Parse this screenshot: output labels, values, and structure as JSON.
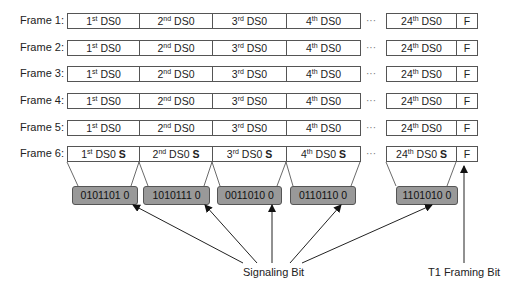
{
  "frames": [
    {
      "label": "Frame 1:",
      "cells": [
        {
          "n": "1",
          "sup": "st",
          "t": " DS0",
          "s": ""
        },
        {
          "n": "2",
          "sup": "nd",
          "t": " DS0",
          "s": ""
        },
        {
          "n": "3",
          "sup": "rd",
          "t": " DS0",
          "s": ""
        },
        {
          "n": "4",
          "sup": "th",
          "t": " DS0",
          "s": ""
        },
        {
          "n": "24",
          "sup": "th",
          "t": " DS0",
          "s": ""
        }
      ],
      "f": "F"
    },
    {
      "label": "Frame 2:",
      "cells": [
        {
          "n": "1",
          "sup": "st",
          "t": " DS0",
          "s": ""
        },
        {
          "n": "2",
          "sup": "nd",
          "t": " DS0",
          "s": ""
        },
        {
          "n": "3",
          "sup": "rd",
          "t": " DS0",
          "s": ""
        },
        {
          "n": "4",
          "sup": "th",
          "t": " DS0",
          "s": ""
        },
        {
          "n": "24",
          "sup": "th",
          "t": " DS0",
          "s": ""
        }
      ],
      "f": "F"
    },
    {
      "label": "Frame 3:",
      "cells": [
        {
          "n": "1",
          "sup": "st",
          "t": " DS0",
          "s": ""
        },
        {
          "n": "2",
          "sup": "nd",
          "t": " DS0",
          "s": ""
        },
        {
          "n": "3",
          "sup": "rd",
          "t": " DS0",
          "s": ""
        },
        {
          "n": "4",
          "sup": "th",
          "t": " DS0",
          "s": ""
        },
        {
          "n": "24",
          "sup": "th",
          "t": " DS0",
          "s": ""
        }
      ],
      "f": "F"
    },
    {
      "label": "Frame 4:",
      "cells": [
        {
          "n": "1",
          "sup": "st",
          "t": " DS0",
          "s": ""
        },
        {
          "n": "2",
          "sup": "nd",
          "t": " DS0",
          "s": ""
        },
        {
          "n": "3",
          "sup": "rd",
          "t": " DS0",
          "s": ""
        },
        {
          "n": "4",
          "sup": "th",
          "t": " DS0",
          "s": ""
        },
        {
          "n": "24",
          "sup": "th",
          "t": " DS0",
          "s": ""
        }
      ],
      "f": "F"
    },
    {
      "label": "Frame 5:",
      "cells": [
        {
          "n": "1",
          "sup": "st",
          "t": " DS0",
          "s": ""
        },
        {
          "n": "2",
          "sup": "nd",
          "t": " DS0",
          "s": ""
        },
        {
          "n": "3",
          "sup": "rd",
          "t": " DS0",
          "s": ""
        },
        {
          "n": "4",
          "sup": "th",
          "t": " DS0",
          "s": ""
        },
        {
          "n": "24",
          "sup": "th",
          "t": " DS0",
          "s": ""
        }
      ],
      "f": "F"
    },
    {
      "label": "Frame 6:",
      "cells": [
        {
          "n": "1",
          "sup": "st",
          "t": " DS0 ",
          "s": "S"
        },
        {
          "n": "2",
          "sup": "nd",
          "t": " DS0 ",
          "s": "S"
        },
        {
          "n": "3",
          "sup": "rd",
          "t": " DS0 ",
          "s": "S"
        },
        {
          "n": "4",
          "sup": "th",
          "t": " DS0 ",
          "s": "S"
        },
        {
          "n": "24",
          "sup": "th",
          "t": " DS0 ",
          "s": "S"
        }
      ],
      "f": "F"
    }
  ],
  "ellipsis": "···",
  "signaling_bytes": [
    "0101101 0",
    "1010111 0",
    "0011010 0",
    "0110110 0",
    "1101010 0"
  ],
  "captions": {
    "signaling": "Signaling Bit",
    "framing": "T1 Framing Bit"
  }
}
